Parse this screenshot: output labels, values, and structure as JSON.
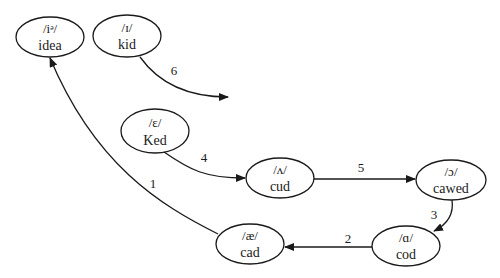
{
  "diagram": {
    "type": "vowel-chain-shift",
    "nodes": [
      {
        "id": "idea",
        "ipa": "/iᵊ/",
        "word": "idea",
        "cx": 50,
        "cy": 37,
        "rx": 34,
        "ry": 20
      },
      {
        "id": "kid",
        "ipa": "/ɪ/",
        "word": "kid",
        "cx": 127,
        "cy": 36,
        "rx": 34,
        "ry": 21
      },
      {
        "id": "Ked",
        "ipa": "/ɛ/",
        "word": "Ked",
        "cx": 155,
        "cy": 131,
        "rx": 34,
        "ry": 22
      },
      {
        "id": "cud",
        "ipa": "/ʌ/",
        "word": "cud",
        "cx": 280,
        "cy": 178,
        "rx": 34,
        "ry": 20
      },
      {
        "id": "cawed",
        "ipa": "/ɔ/",
        "word": "cawed",
        "cx": 451,
        "cy": 180,
        "rx": 35,
        "ry": 20
      },
      {
        "id": "cod",
        "ipa": "/ɑ/",
        "word": "cod",
        "cx": 406,
        "cy": 246,
        "rx": 34,
        "ry": 20
      },
      {
        "id": "cad",
        "ipa": "/æ/",
        "word": "cad",
        "cx": 250,
        "cy": 244,
        "rx": 34,
        "ry": 20
      }
    ],
    "edges": [
      {
        "label": "1",
        "from": "cad",
        "to": "idea",
        "label_x": 153,
        "label_y": 188
      },
      {
        "label": "2",
        "from": "cod",
        "to": "cad",
        "label_x": 348,
        "label_y": 243
      },
      {
        "label": "3",
        "from": "cawed",
        "to": "cod",
        "label_x": 434,
        "label_y": 219
      },
      {
        "label": "4",
        "from": "Ked",
        "to": "cud",
        "label_x": 204,
        "label_y": 162
      },
      {
        "label": "5",
        "from": "cud",
        "to": "cawed",
        "label_x": 361,
        "label_y": 172
      },
      {
        "label": "6",
        "from": "kid",
        "to": "(open)",
        "label_x": 174,
        "label_y": 75
      }
    ]
  }
}
